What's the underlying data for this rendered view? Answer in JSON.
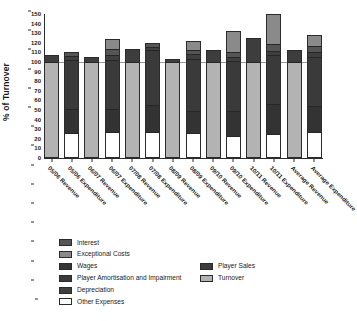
{
  "chart_data": {
    "type": "bar",
    "subtype": "stacked-bar",
    "title": "",
    "xlabel": "",
    "ylabel": "% of Turnover",
    "ylim": [
      0,
      150
    ],
    "ytick_step": 10,
    "yticks": [
      0,
      10,
      20,
      30,
      40,
      50,
      60,
      70,
      80,
      90,
      100,
      110,
      120,
      130,
      140,
      150
    ],
    "grid": false,
    "reference_line": 100,
    "legend_position": "bottom",
    "categories": [
      "05/06 Revenue",
      "05/06 Expenditure",
      "06/07 Revenue",
      "06/07 Expenditure",
      "07/08 Revenue",
      "07/08 Expenditure",
      "08/09 Revenue",
      "08/09 Expenditure",
      "09/10 Revenue",
      "09/10 Expenditure",
      "10/11 Revenue",
      "10/11 Expenditure",
      "Average Revenue",
      "Average Expenditure"
    ],
    "series": [
      {
        "name": "Turnover",
        "color": "#b3b3b3",
        "values": [
          100,
          0,
          100,
          0,
          100,
          0,
          100,
          0,
          100,
          0,
          100,
          0,
          100,
          0
        ]
      },
      {
        "name": "Player Sales",
        "color": "#3d3d3d",
        "values": [
          7,
          0,
          5,
          0,
          14,
          0,
          3,
          0,
          13,
          0,
          25,
          0,
          12,
          0
        ]
      },
      {
        "name": "Other Expenses",
        "color": "#ffffff",
        "values": [
          0,
          24,
          0,
          25,
          0,
          25,
          0,
          26,
          0,
          25,
          0,
          25,
          0,
          25
        ]
      },
      {
        "name": "Wages",
        "color": "#333333",
        "values": [
          0,
          26,
          0,
          25,
          0,
          29,
          0,
          26,
          0,
          30,
          0,
          33,
          0,
          28
        ]
      },
      {
        "name": "Player Amortisation and Impairment",
        "color": "#3a3a3a",
        "values": [
          0,
          52,
          0,
          52,
          0,
          58,
          0,
          60,
          0,
          61,
          0,
          54,
          0,
          52
        ]
      },
      {
        "name": "Depreciation",
        "color": "#3f3f3f",
        "values": [
          0,
          4,
          0,
          5,
          0,
          4,
          0,
          5,
          0,
          5,
          0,
          5,
          0,
          5
        ]
      },
      {
        "name": "Interest",
        "color": "#555555",
        "values": [
          0,
          4,
          0,
          6,
          0,
          4,
          0,
          5,
          0,
          6,
          0,
          8,
          0,
          6
        ]
      },
      {
        "name": "Exceptional Costs",
        "color": "#8a8a8a",
        "values": [
          0,
          0,
          0,
          11,
          0,
          0,
          0,
          10,
          0,
          25,
          0,
          33,
          0,
          12
        ]
      }
    ],
    "bar_totals": [
      107,
      110,
      105,
      124,
      114,
      120,
      103,
      122,
      113,
      132,
      125,
      150,
      112,
      128
    ]
  },
  "legend": {
    "left_column": [
      {
        "label": "Interest",
        "color": "#555555"
      },
      {
        "label": "Exceptional Costs",
        "color": "#8a8a8a"
      },
      {
        "label": "Wages",
        "color": "#333333"
      },
      {
        "label": "Player Amortisation and Impairment",
        "color": "#3a3a3a"
      },
      {
        "label": "Depreciation",
        "color": "#3f3f3f"
      },
      {
        "label": "Other Expenses",
        "color": "#ffffff"
      }
    ],
    "right_column": [
      {
        "label": "Player Sales",
        "color": "#3d3d3d"
      },
      {
        "label": "Turnover",
        "color": "#b3b3b3"
      }
    ]
  }
}
